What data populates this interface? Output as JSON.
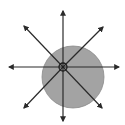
{
  "diagram": {
    "type": "radiating-vectors-from-point-on-disc",
    "colors": {
      "background": "#ffffff",
      "disc_fill": "#a3a3a3",
      "disc_stroke": "#8a8a8a",
      "arrow_stroke": "#2a2a2a",
      "point_stroke": "#1e1e1e"
    },
    "disc": {
      "cx": 73,
      "cy": 77,
      "r": 31
    },
    "origin_point": {
      "cx": 63,
      "cy": 67,
      "r": 4
    },
    "arrows": [
      {
        "name": "arrow-north",
        "x2": 63,
        "y2": 11
      },
      {
        "name": "arrow-south",
        "x2": 63,
        "y2": 121
      },
      {
        "name": "arrow-west",
        "x2": 9,
        "y2": 67
      },
      {
        "name": "arrow-east",
        "x2": 119,
        "y2": 67
      },
      {
        "name": "arrow-northwest",
        "x2": 24,
        "y2": 26
      },
      {
        "name": "arrow-northeast",
        "x2": 103,
        "y2": 27
      },
      {
        "name": "arrow-southwest",
        "x2": 24,
        "y2": 108
      },
      {
        "name": "arrow-southeast",
        "x2": 102,
        "y2": 108
      }
    ]
  }
}
